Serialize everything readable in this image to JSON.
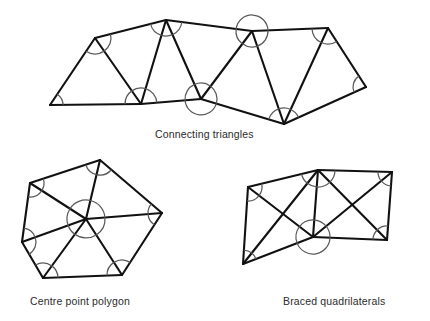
{
  "figure": {
    "background_color": "#ffffff",
    "line_color": "#111111",
    "arc_color": "#5a5a5a",
    "caption_color": "#2b2b2b"
  },
  "diagrams": [
    {
      "id": "connecting-triangles",
      "caption": "Connecting triangles",
      "caption_pos": {
        "x": 155,
        "y": 138
      },
      "stations": [
        {
          "name": "A",
          "x": 50,
          "y": 105
        },
        {
          "name": "B",
          "x": 95,
          "y": 38
        },
        {
          "name": "C",
          "x": 141,
          "y": 104
        },
        {
          "name": "D",
          "x": 166,
          "y": 20
        },
        {
          "name": "E",
          "x": 201,
          "y": 99
        },
        {
          "name": "F",
          "x": 252,
          "y": 31
        },
        {
          "name": "G",
          "x": 284,
          "y": 124
        },
        {
          "name": "H",
          "x": 328,
          "y": 28
        },
        {
          "name": "I",
          "x": 366,
          "y": 87
        }
      ],
      "lines": [
        [
          "A",
          "B"
        ],
        [
          "A",
          "C"
        ],
        [
          "B",
          "C"
        ],
        [
          "B",
          "D"
        ],
        [
          "C",
          "D"
        ],
        [
          "C",
          "E"
        ],
        [
          "D",
          "E"
        ],
        [
          "E",
          "F"
        ],
        [
          "E",
          "G"
        ],
        [
          "F",
          "G"
        ],
        [
          "F",
          "H"
        ],
        [
          "G",
          "H"
        ],
        [
          "G",
          "I"
        ],
        [
          "H",
          "I"
        ],
        [
          "D",
          "F"
        ]
      ],
      "angle_marks": [
        {
          "at": "A",
          "r": 13
        },
        {
          "at": "B",
          "r": 16
        },
        {
          "at": "C",
          "r": 16
        },
        {
          "at": "D",
          "r": 16
        },
        {
          "at": "E",
          "r": 16
        },
        {
          "at": "F",
          "r": 16
        },
        {
          "at": "G",
          "r": 16
        },
        {
          "at": "H",
          "r": 16
        },
        {
          "at": "I",
          "r": 13
        }
      ]
    },
    {
      "id": "centre-point-polygon",
      "caption": "Centre point polygon",
      "caption_pos": {
        "x": 30,
        "y": 305
      },
      "stations": [
        {
          "name": "P1",
          "x": 30,
          "y": 183
        },
        {
          "name": "P2",
          "x": 100,
          "y": 160
        },
        {
          "name": "P3",
          "x": 162,
          "y": 213
        },
        {
          "name": "P4",
          "x": 122,
          "y": 275
        },
        {
          "name": "P5",
          "x": 43,
          "y": 278
        },
        {
          "name": "P6",
          "x": 22,
          "y": 242
        },
        {
          "name": "O",
          "x": 86,
          "y": 219
        }
      ],
      "lines": [
        [
          "P1",
          "P2"
        ],
        [
          "P2",
          "P3"
        ],
        [
          "P3",
          "P4"
        ],
        [
          "P4",
          "P5"
        ],
        [
          "P5",
          "P6"
        ],
        [
          "P6",
          "P1"
        ],
        [
          "O",
          "P1"
        ],
        [
          "O",
          "P2"
        ],
        [
          "O",
          "P3"
        ],
        [
          "O",
          "P4"
        ],
        [
          "O",
          "P5"
        ],
        [
          "O",
          "P6"
        ]
      ],
      "angle_marks": [
        {
          "at": "P1",
          "r": 14
        },
        {
          "at": "P2",
          "r": 15
        },
        {
          "at": "P3",
          "r": 14
        },
        {
          "at": "P4",
          "r": 15
        },
        {
          "at": "P5",
          "r": 15
        },
        {
          "at": "P6",
          "r": 14
        },
        {
          "at": "O",
          "r": 19
        }
      ]
    },
    {
      "id": "braced-quadrilaterals",
      "caption": "Braced quadrilaterals",
      "caption_pos": {
        "x": 283,
        "y": 305
      },
      "stations": [
        {
          "name": "Q1",
          "x": 248,
          "y": 187
        },
        {
          "name": "Q2",
          "x": 318,
          "y": 170
        },
        {
          "name": "Q3",
          "x": 313,
          "y": 237
        },
        {
          "name": "Q4",
          "x": 243,
          "y": 264
        },
        {
          "name": "Q5",
          "x": 392,
          "y": 172
        },
        {
          "name": "Q6",
          "x": 387,
          "y": 240
        }
      ],
      "lines": [
        [
          "Q1",
          "Q2"
        ],
        [
          "Q2",
          "Q3"
        ],
        [
          "Q3",
          "Q4"
        ],
        [
          "Q4",
          "Q1"
        ],
        [
          "Q1",
          "Q3"
        ],
        [
          "Q2",
          "Q4"
        ],
        [
          "Q2",
          "Q5"
        ],
        [
          "Q5",
          "Q6"
        ],
        [
          "Q6",
          "Q3"
        ],
        [
          "Q2",
          "Q6"
        ],
        [
          "Q5",
          "Q3"
        ]
      ],
      "angle_marks": [
        {
          "at": "Q1",
          "r": 14
        },
        {
          "at": "Q2",
          "r": 17
        },
        {
          "at": "Q3",
          "r": 17
        },
        {
          "at": "Q4",
          "r": 14
        },
        {
          "at": "Q5",
          "r": 14
        },
        {
          "at": "Q6",
          "r": 14
        }
      ]
    }
  ]
}
